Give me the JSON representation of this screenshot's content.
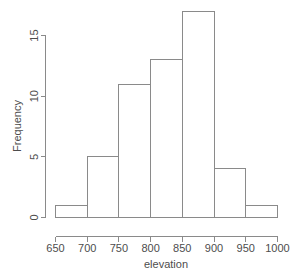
{
  "chart_data": {
    "type": "bar",
    "subtype": "histogram",
    "title": "",
    "subtitle": "",
    "xlabel": "elevation",
    "ylabel": "Frequency",
    "categories": [
      "650-700",
      "700-750",
      "750-800",
      "800-850",
      "850-900",
      "900-950",
      "950-1000"
    ],
    "bin_edges": [
      650,
      700,
      750,
      800,
      850,
      900,
      950,
      1000
    ],
    "bin_width": 50,
    "values": [
      1,
      5,
      11,
      13,
      17,
      4,
      1
    ],
    "series": [
      {
        "name": "Frequency",
        "values": [
          1,
          5,
          11,
          13,
          17,
          4,
          1
        ]
      }
    ],
    "xlim": [
      650,
      1000
    ],
    "ylim": [
      0,
      17
    ],
    "x_ticks": [
      650,
      700,
      750,
      800,
      850,
      900,
      950,
      1000
    ],
    "x_tick_labels": [
      "650",
      "700",
      "750",
      "800",
      "850",
      "900",
      "950",
      "1000"
    ],
    "y_ticks": [
      0,
      5,
      10,
      15
    ],
    "y_tick_labels": [
      "0",
      "5",
      "10",
      "15"
    ],
    "y_axis_range": [
      0,
      15
    ],
    "grid": false,
    "legend": false,
    "legend_position": "none",
    "bar_fill": "none",
    "bar_border_color": "#8a8a8a",
    "axis_color": "#8a8a8a",
    "text_color": "#4d4d4d",
    "background_color": "#ffffff",
    "annotations": []
  },
  "axes": {
    "x_title": "elevation",
    "y_title": "Frequency"
  }
}
